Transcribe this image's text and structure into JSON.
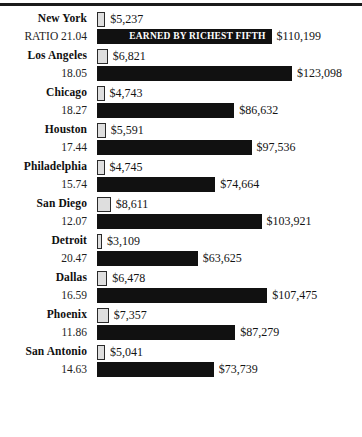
{
  "figure": {
    "poorest_note": "EARNED BY POOREST FIFTH",
    "richest_note": "EARNED BY RICHEST FIFTH",
    "ratio_prefix": "RATIO "
  },
  "chart_data": {
    "type": "bar",
    "title": "",
    "xlabel": "",
    "ylabel": "",
    "orientation": "horizontal",
    "grid": false,
    "legend_position": "in-plot-first-row",
    "xlim": [
      0,
      123098
    ],
    "annotations": [
      "$5,237 EARNED BY POOREST FIFTH",
      "EARNED BY RICHEST FIFTH"
    ],
    "categories": [
      "New York",
      "Los Angeles",
      "Chicago",
      "Houston",
      "Philadelphia",
      "San Diego",
      "Detroit",
      "Dallas",
      "Phoenix",
      "San Antonio"
    ],
    "series": [
      {
        "name": "EARNED BY POOREST FIFTH",
        "values": [
          5237,
          6821,
          4743,
          5591,
          4745,
          8611,
          3109,
          6478,
          7357,
          5041
        ]
      },
      {
        "name": "EARNED BY RICHEST FIFTH",
        "values": [
          110199,
          123098,
          86632,
          97536,
          74664,
          103921,
          63625,
          107475,
          87279,
          73739
        ]
      }
    ],
    "ratios": [
      21.04,
      18.05,
      18.27,
      17.44,
      15.74,
      12.07,
      20.47,
      16.59,
      11.86,
      14.63
    ]
  },
  "rows": [
    {
      "city": "New York",
      "ratio": "RATIO 21.04",
      "poor_label": "$5,237",
      "rich_label": "$110,199",
      "poor_value": 5237,
      "rich_value": 110199
    },
    {
      "city": "Los Angeles",
      "ratio": "18.05",
      "poor_label": "$6,821",
      "rich_label": "$123,098",
      "poor_value": 6821,
      "rich_value": 123098
    },
    {
      "city": "Chicago",
      "ratio": "18.27",
      "poor_label": "$4,743",
      "rich_label": "$86,632",
      "poor_value": 4743,
      "rich_value": 86632
    },
    {
      "city": "Houston",
      "ratio": "17.44",
      "poor_label": "$5,591",
      "rich_label": "$97,536",
      "poor_value": 5591,
      "rich_value": 97536
    },
    {
      "city": "Philadelphia",
      "ratio": "15.74",
      "poor_label": "$4,745",
      "rich_label": "$74,664",
      "poor_value": 4745,
      "rich_value": 74664
    },
    {
      "city": "San Diego",
      "ratio": "12.07",
      "poor_label": "$8,611",
      "rich_label": "$103,921",
      "poor_value": 8611,
      "rich_value": 103921
    },
    {
      "city": "Detroit",
      "ratio": "20.47",
      "poor_label": "$3,109",
      "rich_label": "$63,625",
      "poor_value": 3109,
      "rich_value": 63625
    },
    {
      "city": "Dallas",
      "ratio": "16.59",
      "poor_label": "$6,478",
      "rich_label": "$107,475",
      "poor_value": 6478,
      "rich_value": 107475
    },
    {
      "city": "Phoenix",
      "ratio": "11.86",
      "poor_label": "$7,357",
      "rich_label": "$87,279",
      "poor_value": 7357,
      "rich_value": 87279
    },
    {
      "city": "San Antonio",
      "ratio": "14.63",
      "poor_label": "$5,041",
      "rich_label": "$73,739",
      "poor_value": 5041,
      "rich_value": 73739
    }
  ]
}
